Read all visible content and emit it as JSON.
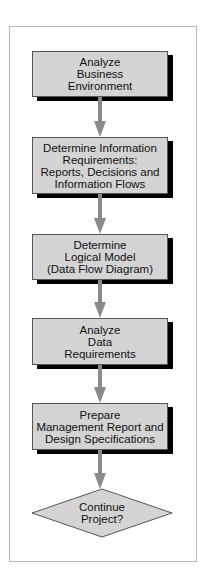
{
  "diagram": {
    "type": "flowchart",
    "colors": {
      "box_fill": "#d4d4d4",
      "shadow": "#000000",
      "arrow": "#8a8a8a",
      "frame": "#b8b8b8"
    },
    "steps": [
      {
        "label": "Analyze\nBusiness\nEnvironment"
      },
      {
        "label": "Determine Information\nRequirements:\nReports, Decisions and\nInformation Flows"
      },
      {
        "label": "Determine\nLogical Model\n(Data Flow Diagram)"
      },
      {
        "label": "Analyze\nData\nRequirements"
      },
      {
        "label": "Prepare\nManagement Report and\nDesign Specifications"
      }
    ],
    "decision": {
      "label": "Continue\nProject?"
    }
  }
}
